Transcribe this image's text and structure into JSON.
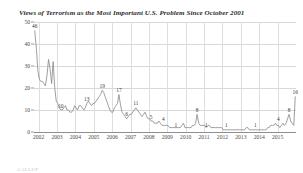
{
  "chart_data": {
    "type": "line",
    "title": "Views of Terrorism as the Most Important U.S. Problem Since October 2001",
    "xlabel": "",
    "ylabel": "",
    "ylim": [
      0,
      50
    ],
    "xlim": [
      2001.75,
      2016.0
    ],
    "yticks": [
      0,
      10,
      20,
      30,
      40,
      50
    ],
    "xticks": [
      2002,
      2003,
      2004,
      2005,
      2006,
      2007,
      2008,
      2009,
      2010,
      2011,
      2012,
      2013,
      2014,
      2015
    ],
    "xtick_labels": [
      "2002",
      "2003",
      "2004",
      "2005",
      "2006",
      "2007",
      "2008",
      "2009",
      "2010",
      "2011",
      "2012",
      "2013",
      "2014",
      "2015"
    ],
    "grid": true,
    "legend": null,
    "series_name": "Terrorism as Most Important Problem (%)",
    "line_color": "#8c8c8c",
    "x": [
      2001.79,
      2001.88,
      2001.96,
      2002.04,
      2002.12,
      2002.21,
      2002.29,
      2002.37,
      2002.46,
      2002.54,
      2002.62,
      2002.71,
      2002.79,
      2002.88,
      2002.96,
      2003.04,
      2003.12,
      2003.21,
      2003.29,
      2003.37,
      2003.46,
      2003.54,
      2003.62,
      2003.71,
      2003.79,
      2003.88,
      2003.96,
      2004.04,
      2004.12,
      2004.21,
      2004.29,
      2004.37,
      2004.46,
      2004.54,
      2004.62,
      2004.71,
      2004.79,
      2004.88,
      2004.96,
      2005.04,
      2005.12,
      2005.21,
      2005.29,
      2005.37,
      2005.46,
      2005.54,
      2005.62,
      2005.71,
      2005.79,
      2005.88,
      2005.96,
      2006.04,
      2006.12,
      2006.21,
      2006.29,
      2006.37,
      2006.46,
      2006.54,
      2006.62,
      2006.71,
      2006.79,
      2006.88,
      2006.96,
      2007.04,
      2007.12,
      2007.21,
      2007.29,
      2007.37,
      2007.46,
      2007.54,
      2007.62,
      2007.71,
      2007.79,
      2007.88,
      2007.96,
      2008.04,
      2008.12,
      2008.21,
      2008.29,
      2008.37,
      2008.46,
      2008.54,
      2008.62,
      2008.71,
      2008.79,
      2008.88,
      2008.96,
      2009.04,
      2009.12,
      2009.21,
      2009.29,
      2009.37,
      2009.46,
      2009.54,
      2009.62,
      2009.71,
      2009.79,
      2009.88,
      2009.96,
      2010.04,
      2010.12,
      2010.21,
      2010.29,
      2010.37,
      2010.46,
      2010.54,
      2010.62,
      2010.71,
      2010.79,
      2010.88,
      2010.96,
      2011.04,
      2011.12,
      2011.21,
      2011.29,
      2011.37,
      2011.46,
      2011.54,
      2011.62,
      2011.71,
      2011.79,
      2011.88,
      2011.96,
      2012.04,
      2012.12,
      2012.21,
      2012.29,
      2012.37,
      2012.46,
      2012.54,
      2012.62,
      2012.71,
      2012.79,
      2012.88,
      2012.96,
      2013.04,
      2013.12,
      2013.21,
      2013.29,
      2013.37,
      2013.46,
      2013.54,
      2013.62,
      2013.71,
      2013.79,
      2013.88,
      2013.96,
      2014.04,
      2014.12,
      2014.21,
      2014.29,
      2014.37,
      2014.46,
      2014.54,
      2014.62,
      2014.71,
      2014.79,
      2014.88,
      2014.96,
      2015.04,
      2015.12,
      2015.21,
      2015.29,
      2015.37,
      2015.46,
      2015.54,
      2015.62,
      2015.71,
      2015.79,
      2015.88,
      2015.96
    ],
    "values": [
      46,
      38,
      28,
      24,
      23,
      23,
      22,
      21,
      26,
      33,
      29,
      22,
      32,
      20,
      14,
      13,
      11,
      10,
      10,
      11,
      12,
      10,
      10,
      9,
      9,
      10,
      12,
      11,
      10,
      12,
      12,
      11,
      10,
      11,
      13,
      14,
      13,
      12,
      13,
      13,
      14,
      15,
      16,
      17,
      19,
      18,
      16,
      14,
      12,
      10,
      9,
      9,
      11,
      12,
      13,
      17,
      12,
      9,
      8,
      7,
      6,
      7,
      8,
      8,
      9,
      10,
      11,
      10,
      9,
      8,
      7,
      8,
      9,
      7,
      6,
      6,
      5,
      5,
      4,
      4,
      4,
      5,
      4,
      3,
      3,
      3,
      3,
      3,
      2,
      2,
      2,
      2,
      2,
      2,
      2,
      2,
      3,
      4,
      2,
      2,
      2,
      2,
      2,
      3,
      3,
      4,
      8,
      4,
      3,
      3,
      3,
      3,
      2,
      3,
      3,
      2,
      2,
      2,
      2,
      2,
      2,
      2,
      2,
      1,
      1,
      1,
      1,
      1,
      1,
      1,
      1,
      1,
      1,
      1,
      1,
      1,
      1,
      1,
      2,
      2,
      1,
      1,
      1,
      1,
      1,
      1,
      1,
      1,
      1,
      1,
      1,
      1,
      2,
      2,
      3,
      3,
      3,
      4,
      3,
      3,
      2,
      3,
      4,
      3,
      4,
      6,
      8,
      5,
      4,
      3,
      16
    ],
    "annotations": [
      {
        "label": "46",
        "x": 2001.79,
        "y": 46
      },
      {
        "label": "10",
        "x": 2003.21,
        "y": 10
      },
      {
        "label": "13",
        "x": 2004.62,
        "y": 13
      },
      {
        "label": "19",
        "x": 2005.46,
        "y": 19
      },
      {
        "label": "17",
        "x": 2006.37,
        "y": 17
      },
      {
        "label": "6",
        "x": 2006.79,
        "y": 6
      },
      {
        "label": "11",
        "x": 2007.29,
        "y": 11
      },
      {
        "label": "5",
        "x": 2008.12,
        "y": 5
      },
      {
        "label": "4",
        "x": 2008.79,
        "y": 4
      },
      {
        "label": "1",
        "x": 2009.46,
        "y": 1
      },
      {
        "label": "8",
        "x": 2010.62,
        "y": 8
      },
      {
        "label": "1",
        "x": 2011.12,
        "y": 1
      },
      {
        "label": "1",
        "x": 2012.21,
        "y": 1
      },
      {
        "label": "1",
        "x": 2013.79,
        "y": 1
      },
      {
        "label": "4",
        "x": 2015.04,
        "y": 4
      },
      {
        "label": "8",
        "x": 2015.62,
        "y": 8
      },
      {
        "label": "16",
        "x": 2015.96,
        "y": 16
      }
    ]
  },
  "footnote": "GALLUP"
}
